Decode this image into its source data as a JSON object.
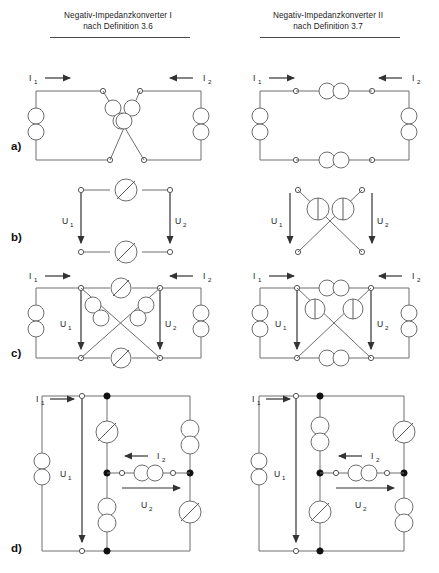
{
  "figure": {
    "background": "#ffffff",
    "wire_color": "#6e6e6e",
    "node_open_color": "#ffffff",
    "node_filled_color": "#111111",
    "text_color": "#1a1a1a"
  },
  "columns": [
    {
      "id": "col-1",
      "title_line1": "Negativ-Impedanzkonverter I",
      "title_line2": "nach Definition 3.6",
      "source_symbol": "diagonal-slash-circle"
    },
    {
      "id": "col-2",
      "title_line1": "Negativ-Impedanzkonverter II",
      "title_line2": "nach Definition 3.7",
      "source_symbol": "vertical-bar-circle"
    }
  ],
  "rows": [
    {
      "id": "row-a",
      "label": "a)"
    },
    {
      "id": "row-b",
      "label": "b)"
    },
    {
      "id": "row-c",
      "label": "c)"
    },
    {
      "id": "row-d",
      "label": "d)"
    }
  ],
  "labels": {
    "i1": "I",
    "i1_sub": "1",
    "i2": "I",
    "i2_sub": "2",
    "u1": "U",
    "u1_sub": "1",
    "u2": "U",
    "u2_sub": "2"
  }
}
